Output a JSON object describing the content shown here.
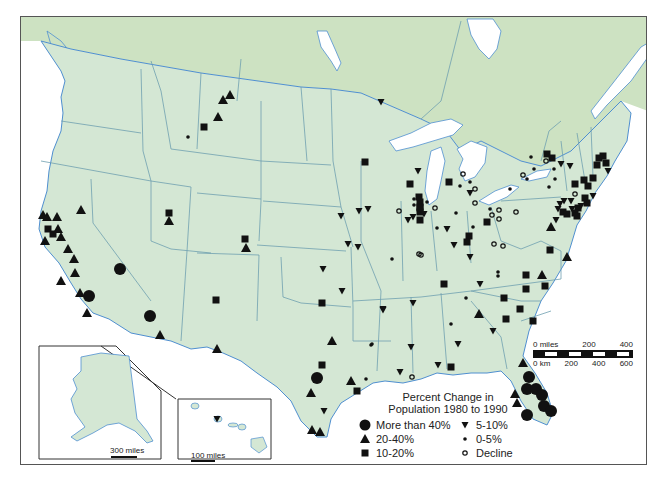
{
  "map": {
    "title": "Percent Change in Population 1980 to 1990",
    "colors": {
      "us_land": "#d4e7d4",
      "canada_land": "#cde2c2",
      "water": "#ffffff",
      "borders": "#6f9fb0",
      "coast": "#4f8fd0",
      "marker": "#111111"
    }
  },
  "legend": {
    "title_line1": "Percent Change in",
    "title_line2": "Population 1980 to 1990",
    "items": [
      {
        "symbol": "large-circle",
        "label": "More than 40%"
      },
      {
        "symbol": "down-triangle",
        "label": "5-10%"
      },
      {
        "symbol": "up-triangle",
        "label": "20-40%"
      },
      {
        "symbol": "small-dot",
        "label": "0-5%"
      },
      {
        "symbol": "square",
        "label": "10-20%"
      },
      {
        "symbol": "open-circle",
        "label": "Decline"
      }
    ]
  },
  "scale_bar": {
    "miles_labels": [
      "0 miles",
      "200",
      "400"
    ],
    "km_labels": [
      "0 km",
      "200",
      "400",
      "600"
    ]
  },
  "insets": {
    "alaska": {
      "scale_label": "300 miles"
    },
    "hawaii": {
      "scale_label": "100 miles"
    }
  },
  "markers": [
    {
      "type": "up-triangle",
      "x": 229,
      "y": 94
    },
    {
      "type": "up-triangle",
      "x": 222,
      "y": 99
    },
    {
      "type": "up-triangle",
      "x": 217,
      "y": 116
    },
    {
      "type": "square",
      "x": 203,
      "y": 126
    },
    {
      "type": "small-dot",
      "x": 187,
      "y": 136
    },
    {
      "type": "down-triangle",
      "x": 380,
      "y": 101
    },
    {
      "type": "up-triangle",
      "x": 42,
      "y": 214
    },
    {
      "type": "up-triangle",
      "x": 46,
      "y": 216
    },
    {
      "type": "up-triangle",
      "x": 56,
      "y": 216
    },
    {
      "type": "up-triangle",
      "x": 80,
      "y": 209
    },
    {
      "type": "square",
      "x": 47,
      "y": 228
    },
    {
      "type": "square",
      "x": 52,
      "y": 233
    },
    {
      "type": "up-triangle",
      "x": 57,
      "y": 228
    },
    {
      "type": "up-triangle",
      "x": 44,
      "y": 240
    },
    {
      "type": "up-triangle",
      "x": 60,
      "y": 236
    },
    {
      "type": "up-triangle",
      "x": 67,
      "y": 248
    },
    {
      "type": "up-triangle",
      "x": 73,
      "y": 258
    },
    {
      "type": "up-triangle",
      "x": 74,
      "y": 272
    },
    {
      "type": "up-triangle",
      "x": 60,
      "y": 280
    },
    {
      "type": "large-circle",
      "x": 119,
      "y": 268
    },
    {
      "type": "up-triangle",
      "x": 79,
      "y": 292
    },
    {
      "type": "large-circle",
      "x": 88,
      "y": 295
    },
    {
      "type": "up-triangle",
      "x": 86,
      "y": 312
    },
    {
      "type": "large-circle",
      "x": 149,
      "y": 315
    },
    {
      "type": "up-triangle",
      "x": 159,
      "y": 334
    },
    {
      "type": "square",
      "x": 168,
      "y": 212
    },
    {
      "type": "up-triangle",
      "x": 168,
      "y": 220
    },
    {
      "type": "square",
      "x": 244,
      "y": 238
    },
    {
      "type": "up-triangle",
      "x": 245,
      "y": 247
    },
    {
      "type": "square",
      "x": 215,
      "y": 299
    },
    {
      "type": "up-triangle",
      "x": 216,
      "y": 348
    },
    {
      "type": "down-triangle",
      "x": 340,
      "y": 215
    },
    {
      "type": "down-triangle",
      "x": 358,
      "y": 210
    },
    {
      "type": "down-triangle",
      "x": 357,
      "y": 246
    },
    {
      "type": "down-triangle",
      "x": 322,
      "y": 268
    },
    {
      "type": "down-triangle",
      "x": 341,
      "y": 290
    },
    {
      "type": "square",
      "x": 321,
      "y": 302
    },
    {
      "type": "down-triangle",
      "x": 382,
      "y": 308
    },
    {
      "type": "small-dot",
      "x": 370,
      "y": 344
    },
    {
      "type": "up-triangle",
      "x": 331,
      "y": 340
    },
    {
      "type": "square",
      "x": 321,
      "y": 364
    },
    {
      "type": "large-circle",
      "x": 316,
      "y": 377
    },
    {
      "type": "up-triangle",
      "x": 350,
      "y": 380
    },
    {
      "type": "small-dot",
      "x": 365,
      "y": 378
    },
    {
      "type": "up-triangle",
      "x": 310,
      "y": 392
    },
    {
      "type": "square",
      "x": 356,
      "y": 390
    },
    {
      "type": "down-triangle",
      "x": 323,
      "y": 410
    },
    {
      "type": "up-triangle",
      "x": 311,
      "y": 429
    },
    {
      "type": "up-triangle",
      "x": 319,
      "y": 431
    },
    {
      "type": "square",
      "x": 364,
      "y": 161
    },
    {
      "type": "down-triangle",
      "x": 417,
      "y": 170
    },
    {
      "type": "square",
      "x": 409,
      "y": 183
    },
    {
      "type": "square",
      "x": 448,
      "y": 181
    },
    {
      "type": "small-dot",
      "x": 413,
      "y": 198
    },
    {
      "type": "square",
      "x": 419,
      "y": 201
    },
    {
      "type": "square",
      "x": 418,
      "y": 196
    },
    {
      "type": "square",
      "x": 419,
      "y": 206
    },
    {
      "type": "square",
      "x": 419,
      "y": 211
    },
    {
      "type": "square",
      "x": 419,
      "y": 219
    },
    {
      "type": "small-dot",
      "x": 413,
      "y": 204
    },
    {
      "type": "square",
      "x": 419,
      "y": 207
    },
    {
      "type": "down-triangle",
      "x": 423,
      "y": 213
    },
    {
      "type": "small-dot",
      "x": 426,
      "y": 201
    },
    {
      "type": "open-circle",
      "x": 434,
      "y": 207
    },
    {
      "type": "open-circle",
      "x": 398,
      "y": 210
    },
    {
      "type": "down-triangle",
      "x": 367,
      "y": 208
    },
    {
      "type": "down-triangle",
      "x": 407,
      "y": 219
    },
    {
      "type": "down-triangle",
      "x": 347,
      "y": 243
    },
    {
      "type": "small-dot",
      "x": 391,
      "y": 258
    },
    {
      "type": "down-triangle",
      "x": 412,
      "y": 216
    },
    {
      "type": "open-circle",
      "x": 462,
      "y": 173
    },
    {
      "type": "small-dot",
      "x": 469,
      "y": 181
    },
    {
      "type": "small-dot",
      "x": 459,
      "y": 185
    },
    {
      "type": "down-triangle",
      "x": 469,
      "y": 192
    },
    {
      "type": "open-circle",
      "x": 474,
      "y": 188
    },
    {
      "type": "open-circle",
      "x": 474,
      "y": 202
    },
    {
      "type": "small-dot",
      "x": 455,
      "y": 212
    },
    {
      "type": "square",
      "x": 486,
      "y": 221
    },
    {
      "type": "down-triangle",
      "x": 446,
      "y": 228
    },
    {
      "type": "small-dot",
      "x": 472,
      "y": 226
    },
    {
      "type": "square",
      "x": 468,
      "y": 235
    },
    {
      "type": "square",
      "x": 466,
      "y": 241
    },
    {
      "type": "open-circle",
      "x": 498,
      "y": 209
    },
    {
      "type": "open-circle",
      "x": 491,
      "y": 214
    },
    {
      "type": "small-dot",
      "x": 489,
      "y": 208
    },
    {
      "type": "open-circle",
      "x": 498,
      "y": 218
    },
    {
      "type": "open-circle",
      "x": 515,
      "y": 211
    },
    {
      "type": "open-circle",
      "x": 493,
      "y": 243
    },
    {
      "type": "open-circle",
      "x": 502,
      "y": 245
    },
    {
      "type": "small-dot",
      "x": 436,
      "y": 227
    },
    {
      "type": "down-triangle",
      "x": 453,
      "y": 244
    },
    {
      "type": "open-circle",
      "x": 418,
      "y": 253
    },
    {
      "type": "open-circle",
      "x": 420,
      "y": 254
    },
    {
      "type": "down-triangle",
      "x": 469,
      "y": 256
    },
    {
      "type": "open-circle",
      "x": 545,
      "y": 160
    },
    {
      "type": "open-circle",
      "x": 522,
      "y": 174
    },
    {
      "type": "small-dot",
      "x": 533,
      "y": 168
    },
    {
      "type": "small-dot",
      "x": 553,
      "y": 168
    },
    {
      "type": "down-triangle",
      "x": 569,
      "y": 165
    },
    {
      "type": "small-dot",
      "x": 526,
      "y": 178
    },
    {
      "type": "small-dot",
      "x": 554,
      "y": 178
    },
    {
      "type": "small-dot",
      "x": 548,
      "y": 186
    },
    {
      "type": "small-dot",
      "x": 509,
      "y": 188
    },
    {
      "type": "square",
      "x": 574,
      "y": 183
    },
    {
      "type": "square",
      "x": 583,
      "y": 179
    },
    {
      "type": "square",
      "x": 592,
      "y": 177
    },
    {
      "type": "square",
      "x": 587,
      "y": 185
    },
    {
      "type": "open-circle",
      "x": 574,
      "y": 193
    },
    {
      "type": "square",
      "x": 584,
      "y": 197
    },
    {
      "type": "square",
      "x": 586,
      "y": 202
    },
    {
      "type": "down-triangle",
      "x": 592,
      "y": 195
    },
    {
      "type": "square",
      "x": 598,
      "y": 157
    },
    {
      "type": "square",
      "x": 602,
      "y": 155
    },
    {
      "type": "square",
      "x": 605,
      "y": 162
    },
    {
      "type": "square",
      "x": 596,
      "y": 164
    },
    {
      "type": "down-triangle",
      "x": 607,
      "y": 170
    },
    {
      "type": "down-triangle",
      "x": 557,
      "y": 208
    },
    {
      "type": "square",
      "x": 562,
      "y": 211
    },
    {
      "type": "down-triangle",
      "x": 563,
      "y": 200
    },
    {
      "type": "down-triangle",
      "x": 559,
      "y": 203
    },
    {
      "type": "square",
      "x": 566,
      "y": 213
    },
    {
      "type": "down-triangle",
      "x": 570,
      "y": 200
    },
    {
      "type": "square",
      "x": 577,
      "y": 207
    },
    {
      "type": "down-triangle",
      "x": 571,
      "y": 208
    },
    {
      "type": "square",
      "x": 574,
      "y": 212
    },
    {
      "type": "down-triangle",
      "x": 580,
      "y": 205
    },
    {
      "type": "square",
      "x": 576,
      "y": 215
    },
    {
      "type": "down-triangle",
      "x": 555,
      "y": 219
    },
    {
      "type": "up-triangle",
      "x": 550,
      "y": 226
    },
    {
      "type": "square",
      "x": 549,
      "y": 249
    },
    {
      "type": "up-triangle",
      "x": 566,
      "y": 256
    },
    {
      "type": "small-dot",
      "x": 497,
      "y": 275
    },
    {
      "type": "square",
      "x": 525,
      "y": 274
    },
    {
      "type": "up-triangle",
      "x": 541,
      "y": 274
    },
    {
      "type": "square",
      "x": 546,
      "y": 153
    },
    {
      "type": "square",
      "x": 551,
      "y": 157
    },
    {
      "type": "down-triangle",
      "x": 560,
      "y": 163
    },
    {
      "type": "small-dot",
      "x": 530,
      "y": 156
    },
    {
      "type": "square",
      "x": 443,
      "y": 283
    },
    {
      "type": "down-triangle",
      "x": 479,
      "y": 283
    },
    {
      "type": "small-dot",
      "x": 497,
      "y": 271
    },
    {
      "type": "square",
      "x": 525,
      "y": 288
    },
    {
      "type": "square",
      "x": 544,
      "y": 285
    },
    {
      "type": "square",
      "x": 503,
      "y": 297
    },
    {
      "type": "square",
      "x": 519,
      "y": 308
    },
    {
      "type": "small-dot",
      "x": 465,
      "y": 297
    },
    {
      "type": "down-triangle",
      "x": 412,
      "y": 302
    },
    {
      "type": "square",
      "x": 505,
      "y": 318
    },
    {
      "type": "down-triangle",
      "x": 382,
      "y": 309
    },
    {
      "type": "up-triangle",
      "x": 478,
      "y": 313
    },
    {
      "type": "square",
      "x": 532,
      "y": 320
    },
    {
      "type": "small-dot",
      "x": 450,
      "y": 323
    },
    {
      "type": "down-triangle",
      "x": 492,
      "y": 330
    },
    {
      "type": "down-triangle",
      "x": 457,
      "y": 343
    },
    {
      "type": "down-triangle",
      "x": 410,
      "y": 346
    },
    {
      "type": "small-dot",
      "x": 371,
      "y": 343
    },
    {
      "type": "down-triangle",
      "x": 437,
      "y": 364
    },
    {
      "type": "square",
      "x": 450,
      "y": 366
    },
    {
      "type": "down-triangle",
      "x": 399,
      "y": 371
    },
    {
      "type": "open-circle",
      "x": 411,
      "y": 376
    },
    {
      "type": "up-triangle",
      "x": 522,
      "y": 362
    },
    {
      "type": "large-circle",
      "x": 528,
      "y": 376
    },
    {
      "type": "large-circle",
      "x": 526,
      "y": 388
    },
    {
      "type": "large-circle",
      "x": 535,
      "y": 388
    },
    {
      "type": "large-circle",
      "x": 541,
      "y": 394
    },
    {
      "type": "large-circle",
      "x": 543,
      "y": 405
    },
    {
      "type": "large-circle",
      "x": 550,
      "y": 410
    },
    {
      "type": "up-triangle",
      "x": 514,
      "y": 393
    },
    {
      "type": "up-triangle",
      "x": 516,
      "y": 402
    },
    {
      "type": "large-circle",
      "x": 526,
      "y": 414
    },
    {
      "type": "down-triangle",
      "x": 216,
      "y": 418
    }
  ]
}
